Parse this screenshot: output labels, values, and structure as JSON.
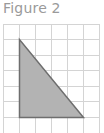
{
  "figure": {
    "title": "Figure 2",
    "grid": {
      "cell_size": 16,
      "columns": 6,
      "rows": 7,
      "origin": [
        3,
        24
      ],
      "line_color": "#d4d4d4"
    },
    "shape": {
      "type": "right-triangle",
      "vertices": [
        [
          19,
          39
        ],
        [
          19,
          117
        ],
        [
          83,
          117
        ]
      ],
      "fill_color": "#b3b3b3",
      "stroke_color": "#6e6e6e",
      "legs_in_units": {
        "height": 5,
        "base": 4
      }
    }
  }
}
